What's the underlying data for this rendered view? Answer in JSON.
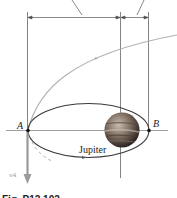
{
  "figure": {
    "caption": "Fig. P12.102",
    "labels": {
      "point_a": "A",
      "point_b": "B",
      "planet": "Jupiter",
      "velocity": "vA"
    },
    "colors": {
      "ellipse": "#3a3a3a",
      "parabola": "#b0b0b0",
      "velocity_arrow": "#9a9a9a",
      "lines": "#555555",
      "planet_dark": "#3b2f28",
      "planet_light": "#b8a89a"
    }
  }
}
